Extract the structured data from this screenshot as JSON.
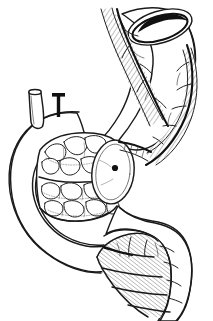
{
  "figure": {
    "title": "Surgical anatomy line drawing",
    "kind": "medical-illustration",
    "style": "black-and-white pen-and-ink line art",
    "background_color": "#ffffff",
    "ink_color": "#111111",
    "hatch_color": "#666666",
    "caption": "",
    "width_px": 213,
    "height_px": 321
  },
  "structures": [
    {
      "id": "esophageal-conduit",
      "label": "Upper tubular conduit with open cut end",
      "position": "top-right",
      "notes": "Curved tube descending from the upper right, terminating superiorly in an elliptical open lumen"
    },
    {
      "id": "open-lumen-ellipse",
      "label": "Open cut lumen",
      "position": "top-right",
      "notes": "Ellipse with thick dark inner rim indicating an open transected end"
    },
    {
      "id": "mesenteric-hatched-band",
      "label": "Hatched vascular pedicle band",
      "position": "along conduit",
      "notes": "Stippled/hatched strip following the conduit with a heavy dark vessel line"
    },
    {
      "id": "vessel-line",
      "label": "Principal vascular arcade",
      "position": "along hatched band",
      "notes": "Continuous thick dark line with small branching twigs"
    },
    {
      "id": "nodular-body",
      "label": "Nodular cobblestone segment",
      "position": "center-left",
      "notes": "Tubular body filled with rounded cobblestone nodules drawn with dotted outlines"
    },
    {
      "id": "cross-section-ellipse",
      "label": "Cut cross-section face with central lumen dot",
      "position": "center",
      "notes": "Elliptical face bearing a small filled dark dot"
    },
    {
      "id": "curved-viscus",
      "label": "C-shaped curved viscus",
      "position": "left",
      "notes": "Broad smooth C-shaped loop forming the left-hand boundary"
    },
    {
      "id": "tube-stub",
      "label": "Small transected tube stub",
      "position": "upper-left",
      "notes": "Short cylinder with elliptical open top"
    },
    {
      "id": "clip-marker",
      "label": "T-shaped ligature clip marker",
      "position": "upper-left",
      "notes": "Solid black T-shaped mark indicating a clip or tie"
    },
    {
      "id": "omental-flap",
      "label": "Hatched omental / mesenteric flap",
      "position": "bottom-center",
      "notes": "Fan-shaped region with dense diagonal hatching and crossing vessel lines"
    },
    {
      "id": "distal-limb",
      "label": "Distal rounded limb",
      "position": "bottom-right",
      "notes": "Smooth rounded tubular limb descending to the lower right margin"
    }
  ],
  "annotations": {
    "text_labels": [],
    "leader_lines": 0,
    "numbers": []
  }
}
